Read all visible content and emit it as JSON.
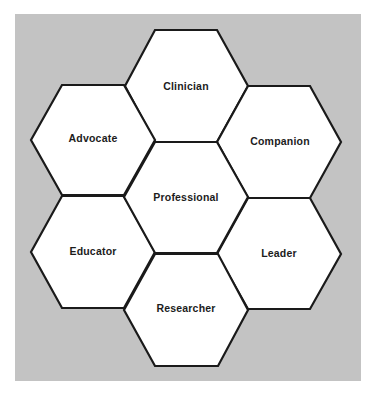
{
  "diagram": {
    "type": "hexagon-cluster",
    "background_color": "#c3c3c3",
    "center": {
      "label": "Professional"
    },
    "hexagons": [
      {
        "id": "clinician",
        "label": "Clinician",
        "position": "top"
      },
      {
        "id": "advocate",
        "label": "Advocate",
        "position": "upper-left"
      },
      {
        "id": "companion",
        "label": "Companion",
        "position": "upper-right"
      },
      {
        "id": "professional",
        "label": "Professional",
        "position": "center"
      },
      {
        "id": "educator",
        "label": "Educator",
        "position": "lower-left"
      },
      {
        "id": "leader",
        "label": "Leader",
        "position": "lower-right"
      },
      {
        "id": "researcher",
        "label": "Researcher",
        "position": "bottom"
      }
    ]
  }
}
